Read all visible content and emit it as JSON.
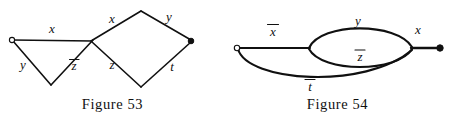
{
  "figures": [
    {
      "id": "figure-53",
      "caption": "Figure 53",
      "nodes": [
        {
          "name": "left-terminal-node",
          "type": "open-circle",
          "x": 12,
          "y": 40
        },
        {
          "name": "bottom-apex-node",
          "type": "vertex",
          "x": 50,
          "y": 84
        },
        {
          "name": "crossing-node",
          "type": "vertex",
          "x": 92,
          "y": 41
        },
        {
          "name": "top-apex-node",
          "type": "vertex",
          "x": 140,
          "y": 12
        },
        {
          "name": "right-terminal-node",
          "type": "filled-dot",
          "x": 191,
          "y": 41
        },
        {
          "name": "lower-apex-node",
          "type": "vertex",
          "x": 140,
          "y": 86
        }
      ],
      "edges": [
        {
          "name": "edge-x-top",
          "label": "x",
          "overline": false,
          "label_x": 52,
          "label_y": 30
        },
        {
          "name": "edge-y-lower-left",
          "label": "y",
          "overline": false,
          "label_x": 23,
          "label_y": 66
        },
        {
          "name": "edge-zbar",
          "label": "z",
          "overline": true,
          "label_x": 74,
          "label_y": 66
        },
        {
          "name": "edge-z-lower",
          "label": "z",
          "overline": false,
          "label_x": 112,
          "label_y": 66
        },
        {
          "name": "edge-x-upper",
          "label": "x",
          "overline": false,
          "label_x": 112,
          "label_y": 20
        },
        {
          "name": "edge-y-upper-right",
          "label": "y",
          "overline": false,
          "label_x": 169,
          "label_y": 18
        },
        {
          "name": "edge-t-lower-right",
          "label": "t",
          "overline": false,
          "label_x": 172,
          "label_y": 68
        }
      ]
    },
    {
      "id": "figure-54",
      "caption": "Figure 54",
      "nodes": [
        {
          "name": "left-terminal-node",
          "type": "open-circle",
          "x": 12,
          "y": 48
        },
        {
          "name": "lens-left-node",
          "type": "vertex",
          "x": 84,
          "y": 48
        },
        {
          "name": "lens-right-node",
          "type": "vertex",
          "x": 187,
          "y": 48
        },
        {
          "name": "right-terminal-node",
          "type": "filled-dot",
          "x": 193,
          "y": 48
        }
      ],
      "edges": [
        {
          "name": "edge-xbar-left",
          "label": "x",
          "overline": true,
          "label_x": 48,
          "label_y": 32
        },
        {
          "name": "edge-y-upper-arc",
          "label": "y",
          "overline": false,
          "label_x": 133,
          "label_y": 21
        },
        {
          "name": "edge-zbar-lower-arc",
          "label": "z",
          "overline": true,
          "label_x": 135,
          "label_y": 56
        },
        {
          "name": "edge-tbar-bottom-arc",
          "label": "t",
          "overline": true,
          "label_x": 85,
          "label_y": 86
        },
        {
          "name": "edge-x-right",
          "label": "x",
          "overline": false,
          "label_x": 193,
          "label_y": 30
        }
      ]
    }
  ]
}
